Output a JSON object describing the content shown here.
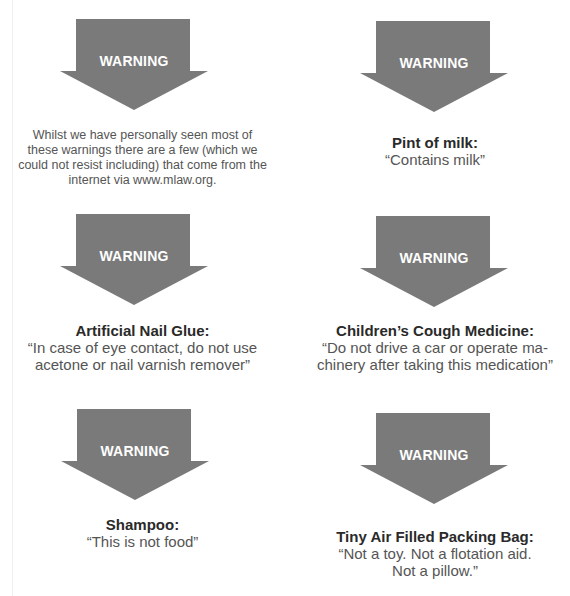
{
  "colors": {
    "arrow": "#7a7a7a",
    "arrow_text": "#ffffff",
    "title_text": "#2a2a2a",
    "body_text": "#555555"
  },
  "arrow_label": "WARNING",
  "intro": {
    "lines": [
      "Whilst we have personally seen most of",
      "these warnings there are a few (which we",
      "could not resist including) that come from the",
      "internet via www.mlaw.org."
    ]
  },
  "warnings": [
    {
      "title": "Pint of milk:",
      "quote_lines": [
        "“Contains milk”"
      ]
    },
    {
      "title": "Artificial Nail Glue:",
      "quote_lines": [
        "“In case of eye contact, do not use",
        "acetone or nail varnish remover”"
      ]
    },
    {
      "title": "Children’s Cough Medicine:",
      "quote_lines": [
        "“Do not drive a car or operate ma-",
        "chinery after taking this medication”"
      ]
    },
    {
      "title": "Shampoo:",
      "quote_lines": [
        "“This is not food”"
      ]
    },
    {
      "title": "Tiny Air Filled Packing Bag:",
      "quote_lines": [
        "“Not a toy.  Not a flotation aid.",
        "Not a pillow.”"
      ]
    }
  ]
}
